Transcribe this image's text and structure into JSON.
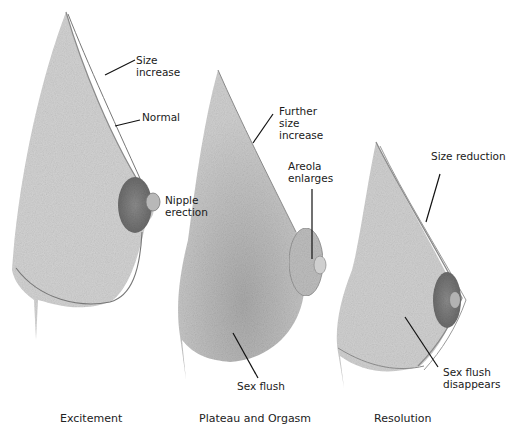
{
  "figure": {
    "panels": [
      {
        "caption": "Excitement",
        "labels": {
          "size_increase": [
            "Size",
            "increase"
          ],
          "normal": [
            "Normal"
          ],
          "nipple": [
            "Nipple",
            "erection"
          ]
        }
      },
      {
        "caption": "Plateau and Orgasm",
        "labels": {
          "further": [
            "Further",
            "size",
            "increase"
          ],
          "areola": [
            "Areola",
            "enlarges"
          ],
          "flush": [
            "Sex flush"
          ]
        }
      },
      {
        "caption": "Resolution",
        "labels": {
          "reduction": [
            "Size reduction"
          ],
          "flush_gone": [
            "Sex flush",
            "disappears"
          ]
        }
      }
    ],
    "colors": {
      "tissue": "#c9c9c9",
      "tissue_dark": "#9a9a9a",
      "outline": "#6e6e6e",
      "areola": "#7a7a7a",
      "leader": "#111111"
    }
  }
}
